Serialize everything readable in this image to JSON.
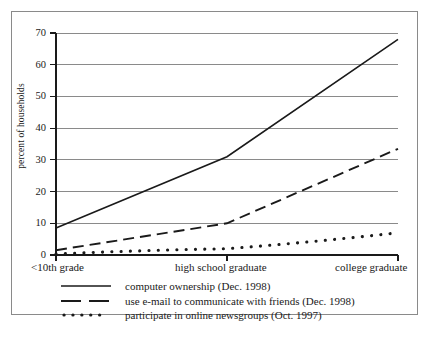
{
  "chart_data": {
    "type": "line",
    "title": "",
    "subtitle": "",
    "xlabel": "",
    "ylabel": "percent of households",
    "ylim": [
      0,
      70
    ],
    "yticks": [
      0,
      10,
      20,
      30,
      40,
      50,
      60,
      70
    ],
    "ytick_labels": [
      "0",
      "10",
      "20",
      "30",
      "40",
      "50",
      "60",
      "70"
    ],
    "grid": true,
    "grid_axis": "y",
    "legend_position": "below-plot",
    "x": [
      0,
      1,
      2
    ],
    "categories": [
      "<10th grade",
      "high school graduate",
      "college graduate"
    ],
    "xtick_labels": [
      "<10th grade",
      "high school graduate",
      "college graduate"
    ],
    "series": [
      {
        "name": "computer ownership (Dec. 1998)",
        "style": "solid",
        "color": "#1a1a1a",
        "values": [
          8.5,
          31,
          68
        ]
      },
      {
        "name": "use e-mail to communicate with friends (Dec. 1998)",
        "style": "dashed",
        "color": "#1a1a1a",
        "values": [
          1.5,
          10,
          33.5
        ]
      },
      {
        "name": "participate in online newsgroups (Oct. 1997)",
        "style": "dotted",
        "color": "#1a1a1a",
        "values": [
          0.3,
          2,
          7
        ]
      }
    ]
  },
  "axes": {
    "y_title": "percent of households",
    "y_ticks": [
      "70",
      "60",
      "50",
      "40",
      "30",
      "20",
      "10",
      "0"
    ],
    "x_ticks": [
      "<10th grade",
      "high school graduate",
      "college graduate"
    ]
  },
  "legend": {
    "items": [
      {
        "label": "computer ownership (Dec. 1998)",
        "style": "solid"
      },
      {
        "label": "use e-mail to communicate with friends (Dec. 1998)",
        "style": "dashed"
      },
      {
        "label": "participate in online newsgroups (Oct. 1997)",
        "style": "dotted"
      }
    ]
  },
  "colors": {
    "ink": "#1a1a1a",
    "grid": "#8a8a8a",
    "frame": "#8a8a8a",
    "background": "#ffffff"
  }
}
